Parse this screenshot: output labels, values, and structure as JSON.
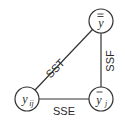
{
  "diagram": {
    "nodes": [
      {
        "id": "grand-mean",
        "label": "y",
        "bars": 2,
        "subscript": ""
      },
      {
        "id": "group-mean",
        "label": "y",
        "bars": 1,
        "subscript": "j"
      },
      {
        "id": "observation",
        "label": "y",
        "bars": 0,
        "subscript": "ij"
      }
    ],
    "edges": [
      {
        "from": "observation",
        "to": "grand-mean",
        "label": "SST"
      },
      {
        "from": "group-mean",
        "to": "grand-mean",
        "label": "SSF"
      },
      {
        "from": "observation",
        "to": "group-mean",
        "label": "SSE"
      }
    ]
  }
}
